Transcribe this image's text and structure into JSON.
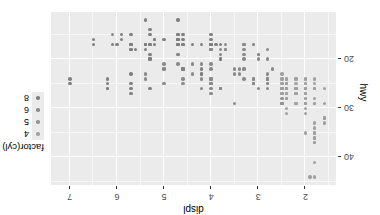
{
  "figure": {
    "rotation_degrees": 180,
    "panel_background": "#ebebeb",
    "gridline_major_color": "#ffffff",
    "gridline_minor_color": "#f7f7f7",
    "plot_background": "#ffffff"
  },
  "axes": {
    "x": {
      "title": "displ",
      "tick_labels": [
        "2",
        "3",
        "4",
        "5",
        "6",
        "7"
      ],
      "tick_values": [
        2,
        3,
        4,
        5,
        6,
        7
      ],
      "range": [
        1.35,
        7.4
      ],
      "minor_ticks": [
        1.5,
        2.5,
        3.5,
        4.5,
        5.5,
        6.5
      ]
    },
    "y": {
      "title": "hwy",
      "tick_labels": [
        "20",
        "30",
        "40"
      ],
      "tick_values": [
        20,
        30,
        40
      ],
      "range": [
        10.4,
        45.6
      ],
      "minor_ticks": [
        15,
        25,
        35,
        45
      ]
    }
  },
  "legend": {
    "title": "factor(cyl)",
    "position": "right",
    "items": [
      {
        "label": "4",
        "color": "#a0a0a0"
      },
      {
        "label": "5",
        "color": "#949494"
      },
      {
        "label": "6",
        "color": "#8a8a8a"
      },
      {
        "label": "8",
        "color": "#808080"
      }
    ]
  },
  "chart_data": {
    "type": "scatter",
    "title": "",
    "xlabel": "displ",
    "ylabel": "hwy",
    "xlim": [
      1.35,
      7.4
    ],
    "ylim": [
      10.4,
      45.6
    ],
    "grid": true,
    "legend_position": "right",
    "color_by": "factor(cyl)",
    "color_map": {
      "4": "#a0a0a0",
      "5": "#949494",
      "6": "#8a8a8a",
      "8": "#808080"
    },
    "series": [
      {
        "name": "4",
        "color": "#a0a0a0",
        "points": [
          [
            1.8,
            29
          ],
          [
            1.8,
            29
          ],
          [
            2.0,
            31
          ],
          [
            2.0,
            30
          ],
          [
            1.8,
            26
          ],
          [
            1.8,
            26
          ],
          [
            2.0,
            27
          ],
          [
            2.0,
            26
          ],
          [
            2.0,
            26
          ],
          [
            2.0,
            25
          ],
          [
            2.8,
            24
          ],
          [
            1.8,
            25
          ],
          [
            1.8,
            24
          ],
          [
            2.0,
            26
          ],
          [
            2.0,
            25
          ],
          [
            2.0,
            24
          ],
          [
            2.4,
            26
          ],
          [
            2.4,
            25
          ],
          [
            2.5,
            24
          ],
          [
            2.5,
            25
          ],
          [
            2.2,
            27
          ],
          [
            2.2,
            25
          ],
          [
            2.4,
            26
          ],
          [
            2.4,
            25
          ],
          [
            2.4,
            24
          ],
          [
            2.4,
            26
          ],
          [
            2.5,
            23
          ],
          [
            2.5,
            24
          ],
          [
            3.3,
            22
          ],
          [
            2.0,
            29
          ],
          [
            2.0,
            29
          ],
          [
            2.0,
            28
          ],
          [
            2.0,
            29
          ],
          [
            2.2,
            26
          ],
          [
            2.2,
            26
          ],
          [
            2.4,
            28
          ],
          [
            2.4,
            27
          ],
          [
            2.4,
            24
          ],
          [
            2.4,
            25
          ],
          [
            2.5,
            27
          ],
          [
            2.5,
            25
          ],
          [
            2.5,
            26
          ],
          [
            2.2,
            26
          ],
          [
            2.2,
            27
          ],
          [
            2.4,
            26
          ],
          [
            2.4,
            25
          ],
          [
            2.4,
            26
          ],
          [
            2.4,
            28
          ],
          [
            2.5,
            26
          ],
          [
            1.6,
            33
          ],
          [
            1.6,
            32
          ],
          [
            1.6,
            32
          ],
          [
            1.6,
            29
          ],
          [
            1.6,
            32
          ],
          [
            1.8,
            34
          ],
          [
            1.8,
            36
          ],
          [
            1.8,
            36
          ],
          [
            2.0,
            29
          ],
          [
            2.4,
            26
          ],
          [
            2.4,
            27
          ],
          [
            2.4,
            30
          ],
          [
            2.4,
            31
          ],
          [
            2.5,
            26
          ],
          [
            2.5,
            26
          ],
          [
            1.8,
            28
          ],
          [
            1.8,
            26
          ],
          [
            2.0,
            29
          ],
          [
            2.0,
            28
          ],
          [
            2.0,
            27
          ],
          [
            2.0,
            24
          ],
          [
            2.8,
            25
          ],
          [
            1.9,
            44
          ],
          [
            2.0,
            29
          ],
          [
            2.0,
            26
          ],
          [
            2.0,
            29
          ],
          [
            2.0,
            29
          ],
          [
            2.5,
            29
          ],
          [
            2.5,
            29
          ],
          [
            1.8,
            33
          ],
          [
            1.8,
            35
          ],
          [
            1.8,
            37
          ],
          [
            1.8,
            35
          ],
          [
            1.8,
            44
          ],
          [
            1.8,
            41
          ],
          [
            1.8,
            37
          ],
          [
            2.0,
            35
          ],
          [
            2.5,
            27
          ],
          [
            2.5,
            26
          ],
          [
            2.2,
            29
          ],
          [
            2.2,
            29
          ],
          [
            2.4,
            28
          ],
          [
            2.4,
            27
          ],
          [
            2.5,
            27
          ],
          [
            2.5,
            26
          ],
          [
            2.0,
            27
          ],
          [
            2.0,
            27
          ],
          [
            2.0,
            27
          ],
          [
            2.0,
            26
          ],
          [
            1.6,
            26
          ],
          [
            2.2,
            24
          ],
          [
            2.2,
            24
          ],
          [
            2.5,
            26
          ]
        ]
      },
      {
        "name": "5",
        "color": "#949494",
        "points": [
          [
            2.5,
            29
          ],
          [
            2.5,
            29
          ],
          [
            2.5,
            28
          ],
          [
            2.5,
            29
          ]
        ]
      },
      {
        "name": "6",
        "color": "#8a8a8a",
        "points": [
          [
            2.8,
            26
          ],
          [
            2.8,
            25
          ],
          [
            3.1,
            25
          ],
          [
            2.8,
            24
          ],
          [
            3.1,
            25
          ],
          [
            2.8,
            23
          ],
          [
            3.1,
            24
          ],
          [
            2.8,
            24
          ],
          [
            2.8,
            24
          ],
          [
            3.1,
            24
          ],
          [
            3.1,
            25
          ],
          [
            4.2,
            23
          ],
          [
            3.0,
            20
          ],
          [
            3.7,
            17
          ],
          [
            4.0,
            17
          ],
          [
            3.0,
            19
          ],
          [
            3.7,
            18
          ],
          [
            4.0,
            18
          ],
          [
            2.8,
            20
          ],
          [
            3.8,
            19
          ],
          [
            3.8,
            20
          ],
          [
            4.0,
            17
          ],
          [
            2.8,
            18
          ],
          [
            3.0,
            19
          ],
          [
            3.3,
            20
          ],
          [
            3.3,
            18
          ],
          [
            3.3,
            17
          ],
          [
            3.3,
            17
          ],
          [
            3.3,
            19
          ],
          [
            3.8,
            18
          ],
          [
            4.0,
            18
          ],
          [
            3.5,
            29
          ],
          [
            3.8,
            26
          ],
          [
            3.8,
            26
          ],
          [
            3.8,
            26
          ],
          [
            4.0,
            25
          ],
          [
            3.1,
            25
          ],
          [
            2.7,
            22
          ],
          [
            3.4,
            22
          ],
          [
            3.4,
            23
          ],
          [
            4.0,
            24
          ],
          [
            4.7,
            21
          ],
          [
            4.0,
            26
          ],
          [
            4.0,
            25
          ],
          [
            4.6,
            22
          ],
          [
            5.0,
            22
          ],
          [
            3.0,
            26
          ],
          [
            3.7,
            18
          ],
          [
            4.0,
            18
          ],
          [
            4.7,
            16
          ],
          [
            4.7,
            16
          ],
          [
            4.7,
            17
          ],
          [
            5.7,
            17
          ],
          [
            6.1,
            15
          ],
          [
            4.0,
            24
          ],
          [
            4.0,
            24
          ],
          [
            4.6,
            17
          ],
          [
            5.0,
            22
          ],
          [
            4.2,
            21
          ],
          [
            4.4,
            23
          ],
          [
            4.6,
            24
          ],
          [
            5.4,
            24
          ],
          [
            3.8,
            26
          ],
          [
            3.8,
            26
          ],
          [
            4.0,
            25
          ],
          [
            4.0,
            27
          ],
          [
            4.6,
            25
          ],
          [
            5.0,
            25
          ],
          [
            4.2,
            26
          ],
          [
            4.2,
            24
          ],
          [
            4.4,
            21
          ],
          [
            4.6,
            22
          ],
          [
            5.4,
            23
          ],
          [
            3.3,
            24
          ],
          [
            3.3,
            22
          ],
          [
            4.0,
            22
          ],
          [
            4.0,
            21
          ],
          [
            4.6,
            22
          ],
          [
            5.0,
            21
          ],
          [
            3.5,
            23
          ],
          [
            3.5,
            22
          ]
        ]
      },
      {
        "name": "8",
        "color": "#808080",
        "points": [
          [
            4.2,
            23
          ],
          [
            4.2,
            22
          ],
          [
            5.3,
            20
          ],
          [
            5.3,
            15
          ],
          [
            5.3,
            20
          ],
          [
            5.7,
            17
          ],
          [
            6.0,
            17
          ],
          [
            5.7,
            26
          ],
          [
            5.7,
            23
          ],
          [
            6.2,
            26
          ],
          [
            6.2,
            25
          ],
          [
            7.0,
            24
          ],
          [
            5.3,
            19
          ],
          [
            5.3,
            14
          ],
          [
            5.7,
            15
          ],
          [
            6.5,
            17
          ],
          [
            5.7,
            27
          ],
          [
            5.7,
            25
          ],
          [
            6.2,
            26
          ],
          [
            6.2,
            24
          ],
          [
            7.0,
            25
          ],
          [
            5.3,
            20
          ],
          [
            5.3,
            17
          ],
          [
            5.7,
            17
          ],
          [
            6.5,
            16
          ],
          [
            4.6,
            17
          ],
          [
            5.4,
            17
          ],
          [
            5.4,
            12
          ],
          [
            4.0,
            17
          ],
          [
            4.0,
            17
          ],
          [
            4.6,
            16
          ],
          [
            5.0,
            16
          ],
          [
            4.2,
            17
          ],
          [
            4.4,
            17
          ],
          [
            4.6,
            15
          ],
          [
            5.4,
            17
          ],
          [
            5.4,
            17
          ],
          [
            4.0,
            17
          ],
          [
            4.7,
            12
          ],
          [
            4.7,
            17
          ],
          [
            4.7,
            16
          ],
          [
            5.7,
            18
          ],
          [
            6.1,
            17
          ],
          [
            4.0,
            15
          ],
          [
            4.0,
            16
          ],
          [
            5.6,
            18
          ],
          [
            3.1,
            17
          ],
          [
            3.8,
            17
          ],
          [
            3.8,
            20
          ],
          [
            5.3,
            26
          ],
          [
            5.3,
            17
          ],
          [
            5.7,
            18
          ],
          [
            5.9,
            16
          ],
          [
            4.7,
            19
          ],
          [
            4.7,
            17
          ],
          [
            4.7,
            17
          ],
          [
            5.2,
            17
          ],
          [
            5.2,
            16
          ],
          [
            3.9,
            17
          ],
          [
            4.7,
            16
          ],
          [
            4.7,
            15
          ],
          [
            4.7,
            15
          ],
          [
            5.2,
            16
          ],
          [
            5.7,
            17
          ],
          [
            5.9,
            15
          ],
          [
            4.6,
            22
          ],
          [
            5.4,
            17
          ],
          [
            5.4,
            18
          ]
        ]
      }
    ]
  }
}
